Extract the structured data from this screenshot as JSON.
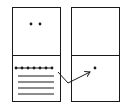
{
  "diagram": {
    "panels": [
      {
        "name": "left-panel",
        "x": 12,
        "y": 7,
        "w": 48,
        "h": 94,
        "split_y": 55,
        "top_cell": {
          "dots": [
            [
              31,
              24
            ],
            [
              40,
              24
            ]
          ]
        },
        "bottom_cell": {
          "dot_row": {
            "y": 68,
            "x_start": 16,
            "x_end": 52,
            "count": 7
          },
          "lines_y": [
            76,
            82,
            88,
            94
          ],
          "lines_x": [
            18,
            54
          ]
        }
      },
      {
        "name": "right-panel",
        "x": 71,
        "y": 7,
        "w": 48,
        "h": 94,
        "split_y": 55,
        "top_cell": {
          "dots": []
        },
        "bottom_cell": {
          "dots": [
            [
              95,
              68
            ]
          ]
        }
      }
    ],
    "arrow": {
      "points": [
        [
          58,
          72
        ],
        [
          68,
          83
        ],
        [
          90,
          72
        ]
      ],
      "direction": "left-to-right"
    },
    "colors": {
      "stroke": "#1a1a1a",
      "background": "#ffffff"
    }
  }
}
